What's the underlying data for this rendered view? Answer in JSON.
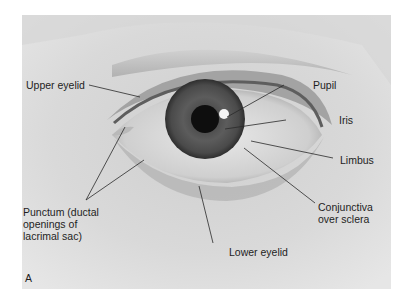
{
  "figure": {
    "panel_letter": "A",
    "labels": {
      "upper_eyelid": "Upper eyelid",
      "pupil": "Pupil",
      "iris": "Iris",
      "limbus": "Limbus",
      "conjunctiva": "Conjunctiva\nover sclera",
      "punctum": "Punctum (ductal\nopenings of\nlacrimal sac)",
      "lower_eyelid": "Lower eyelid"
    }
  }
}
